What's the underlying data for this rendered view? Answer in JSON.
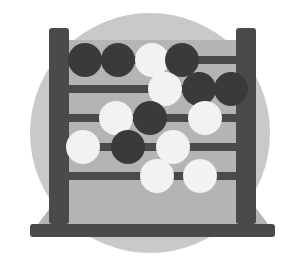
{
  "image": {
    "title": "Abacus icon",
    "alt_text": "Grayscale flat illustration of a five-row abacus with black and white beads on a light gray circular background",
    "width": 299,
    "height": 259,
    "background_color": "#ffffff"
  },
  "palette": {
    "page_background": "#ffffff",
    "circle_background": "#c9c9c9",
    "frame_panel": "#b4b4b4",
    "post": "#4a4a4a",
    "rod": "#4a4a4a",
    "base_bar": "#4a4a4a",
    "base_plinth": "#b4b4b4",
    "bead_dark": "#3a3a3a",
    "bead_light": "#f2f2f2"
  },
  "backdrop": {
    "shape": "circle",
    "cx": 150,
    "cy": 133,
    "r": 120
  },
  "frame": {
    "panel": {
      "x": 62,
      "y": 40,
      "width": 180,
      "height": 183
    },
    "left_post": {
      "x": 49,
      "y": 28,
      "width": 20,
      "height": 196
    },
    "right_post": {
      "x": 236,
      "y": 28,
      "width": 20,
      "height": 196
    },
    "plinth": {
      "points": "50,208 256,208 268,224 38,224"
    },
    "base_bar": {
      "x": 30,
      "y": 224,
      "width": 245,
      "height": 13,
      "rx": 3
    }
  },
  "rods": [
    {
      "index": 1,
      "y": 60,
      "x1": 53,
      "x2": 252,
      "thickness": 8
    },
    {
      "index": 2,
      "y": 89,
      "x1": 53,
      "x2": 252,
      "thickness": 8
    },
    {
      "index": 3,
      "y": 118,
      "x1": 53,
      "x2": 252,
      "thickness": 8
    },
    {
      "index": 4,
      "y": 147,
      "x1": 53,
      "x2": 252,
      "thickness": 8
    },
    {
      "index": 5,
      "y": 176,
      "x1": 53,
      "x2": 252,
      "thickness": 8
    }
  ],
  "bead_radius": 17,
  "bead_rows": [
    {
      "row": 1,
      "cy": 60,
      "beads": [
        {
          "cx": 85,
          "color": "dark"
        },
        {
          "cx": 118,
          "color": "dark"
        },
        {
          "cx": 152,
          "color": "light"
        },
        {
          "cx": 182,
          "color": "dark"
        }
      ]
    },
    {
      "row": 2,
      "cy": 89,
      "beads": [
        {
          "cx": 165,
          "color": "light"
        },
        {
          "cx": 199,
          "color": "dark"
        },
        {
          "cx": 231,
          "color": "dark"
        }
      ]
    },
    {
      "row": 3,
      "cy": 118,
      "beads": [
        {
          "cx": 116,
          "color": "light"
        },
        {
          "cx": 150,
          "color": "dark"
        },
        {
          "cx": 205,
          "color": "light"
        }
      ]
    },
    {
      "row": 4,
      "cy": 147,
      "beads": [
        {
          "cx": 83,
          "color": "light"
        },
        {
          "cx": 128,
          "color": "dark"
        },
        {
          "cx": 173,
          "color": "light"
        }
      ]
    },
    {
      "row": 5,
      "cy": 176,
      "beads": [
        {
          "cx": 157,
          "color": "light"
        },
        {
          "cx": 200,
          "color": "light"
        }
      ]
    }
  ],
  "bead_counts": {
    "total": 15,
    "dark": 8,
    "light": 7
  }
}
